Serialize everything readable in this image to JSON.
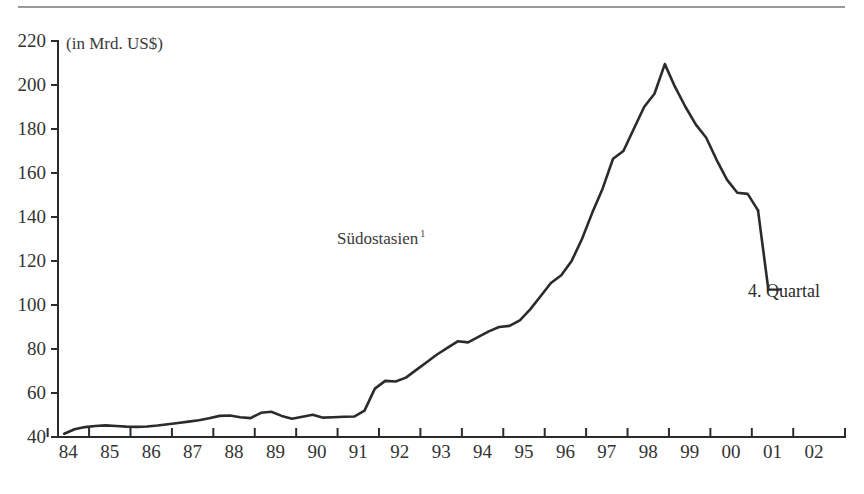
{
  "figure": {
    "unit_note": "(in Mrd. US$)",
    "series_label": "Südostasien",
    "series_footnote": "1",
    "endpoint_label": "4. Quartal",
    "line_color": "#2b2b2b",
    "axis_color": "#2b2b2b",
    "rule_color": "#9a9a9a",
    "background": "#ffffff"
  },
  "chart_data": {
    "type": "line",
    "title": "",
    "subtitle": "",
    "xlabel": "",
    "ylabel": "(in Mrd. US$)",
    "grid": false,
    "legend_position": "inline-annotation",
    "ylim": [
      40,
      220
    ],
    "ytick_labels": [
      "220",
      "200",
      "180",
      "160",
      "140",
      "120",
      "100",
      "80",
      "60",
      "40"
    ],
    "yticks": [
      220,
      200,
      180,
      160,
      140,
      120,
      100,
      80,
      60,
      40
    ],
    "xlim": [
      1983.75,
      2002.75
    ],
    "xtick_labels": [
      "84",
      "85",
      "86",
      "87",
      "88",
      "89",
      "90",
      "91",
      "92",
      "93",
      "94",
      "95",
      "96",
      "97",
      "98",
      "99",
      "00",
      "01",
      "02"
    ],
    "xticks": [
      1984,
      1985,
      1986,
      1987,
      1988,
      1989,
      1990,
      1991,
      1992,
      1993,
      1994,
      1995,
      1996,
      1997,
      1998,
      1999,
      2000,
      2001,
      2002
    ],
    "annotations": [
      {
        "text": "Südostasien 1",
        "x": 1990.0,
        "y": 125
      },
      {
        "text": "4. Quartal",
        "x": 2000.9,
        "y": 107
      }
    ],
    "series": [
      {
        "name": "Südostasien",
        "color": "#2b2b2b",
        "x": [
          1983.9,
          1984.15,
          1984.4,
          1984.65,
          1984.9,
          1985.15,
          1985.4,
          1985.65,
          1985.9,
          1986.15,
          1986.4,
          1986.65,
          1986.9,
          1987.15,
          1987.4,
          1987.65,
          1987.9,
          1988.15,
          1988.4,
          1988.65,
          1988.9,
          1989.15,
          1989.4,
          1989.65,
          1989.9,
          1990.15,
          1990.4,
          1990.65,
          1990.9,
          1991.15,
          1991.4,
          1991.65,
          1991.9,
          1992.15,
          1992.4,
          1992.65,
          1992.9,
          1993.15,
          1993.4,
          1993.65,
          1993.9,
          1994.15,
          1994.4,
          1994.65,
          1994.9,
          1995.15,
          1995.4,
          1995.65,
          1995.9,
          1996.15,
          1996.4,
          1996.65,
          1996.9,
          1997.15,
          1997.4,
          1997.65,
          1997.9,
          1998.15,
          1998.4,
          1998.65,
          1998.9,
          1999.15,
          1999.4,
          1999.65,
          1999.9,
          2000.15,
          2000.4,
          2000.65
        ],
        "y": [
          41.5,
          43.5,
          44.5,
          45.0,
          45.3,
          45.0,
          44.7,
          44.6,
          44.8,
          45.2,
          45.8,
          46.4,
          47.0,
          47.6,
          48.5,
          49.6,
          49.8,
          49.0,
          48.6,
          51.0,
          51.5,
          49.6,
          48.3,
          49.2,
          50.1,
          48.8,
          49.0,
          49.2,
          49.3,
          52.0,
          62.0,
          65.5,
          65.2,
          67.0,
          70.5,
          74.0,
          77.5,
          80.5,
          83.5,
          83.0,
          85.5,
          88.0,
          90.0,
          90.5,
          93.0,
          98.0,
          104.0,
          110.0,
          113.5,
          120.0,
          130.0,
          142.0,
          153.0,
          166.5,
          170.0,
          180.0,
          190.0,
          196.0,
          209.5,
          199.0,
          190.0,
          182.0,
          176.0,
          166.0,
          157.0,
          151.0,
          150.5,
          143.0
        ]
      }
    ],
    "continuation": {
      "x": [
        2000.65,
        2000.9
      ],
      "y": [
        143.0,
        107.0
      ],
      "note": "final quarter tail leading to label"
    }
  }
}
